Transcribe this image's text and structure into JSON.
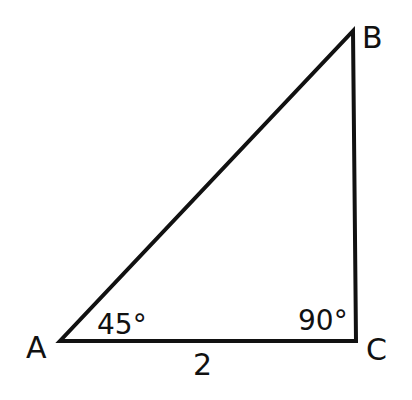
{
  "diagram": {
    "type": "right-triangle",
    "vertices": {
      "A": {
        "label": "A"
      },
      "B": {
        "label": "B"
      },
      "C": {
        "label": "C"
      }
    },
    "angles": {
      "A": "45°",
      "C": "90°"
    },
    "sides": {
      "AC": "2"
    },
    "colors": {
      "stroke": "#111111",
      "background": "#ffffff"
    }
  }
}
